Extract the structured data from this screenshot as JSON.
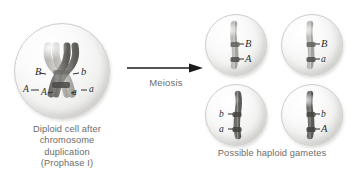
{
  "figure": {
    "process_label": "Meiosis",
    "colors": {
      "cell_fill": "#f2f2f1",
      "cell_outline": "#cfcec9",
      "chromosome_dark": "#5e5d5a",
      "chromosome_light": "#a9a8a4",
      "arrow": "#1a1a1a",
      "caption_text": "#6d6c6a",
      "allele_text": "#2e2e2e"
    }
  },
  "diploid": {
    "caption_lines": [
      "Diploid cell after",
      "chromosome",
      "duplication",
      "(Prophase I)"
    ],
    "chromosome_count": 2,
    "alleles": {
      "upper_left": "B",
      "upper_right": "b",
      "lower_left_outer": "A",
      "lower_left_inner": "A",
      "lower_right_inner": "a",
      "lower_right_outer": "a"
    }
  },
  "arrow": {
    "label": "Meiosis",
    "direction": "right"
  },
  "gametes": {
    "caption": "Possible haploid gametes",
    "cells": [
      {
        "id": "gamete-1",
        "top_allele": "B",
        "bottom_allele": "A",
        "label_side": "right"
      },
      {
        "id": "gamete-2",
        "top_allele": "B",
        "bottom_allele": "a",
        "label_side": "right"
      },
      {
        "id": "gamete-3",
        "top_allele": "b",
        "bottom_allele": "a",
        "label_side": "left"
      },
      {
        "id": "gamete-4",
        "top_allele": "b",
        "bottom_allele": "A",
        "label_side": "right"
      }
    ]
  }
}
